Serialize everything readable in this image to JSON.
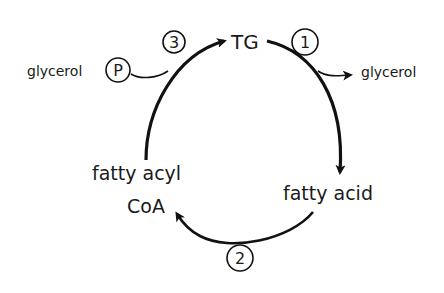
{
  "diagram": {
    "type": "metabolic-cycle",
    "nodes": {
      "tg": "TG",
      "fatty_acid": "fatty acid",
      "fatty_acyl_line1": "fatty acyl",
      "fatty_acyl_line2": "CoA"
    },
    "steps": {
      "step1": "1",
      "step2": "2",
      "step3": "3"
    },
    "side_inputs": {
      "glycerol_in": "glycerol",
      "phosphate": "P"
    },
    "side_outputs": {
      "glycerol_out": "glycerol"
    },
    "edges": [
      {
        "from": "TG",
        "to": "fatty acid",
        "step": "1",
        "byproduct": "glycerol"
      },
      {
        "from": "fatty acid",
        "to": "fatty acyl CoA",
        "step": "2"
      },
      {
        "from": "fatty acyl CoA",
        "to": "TG",
        "step": "3",
        "input": "glycerol-P"
      }
    ],
    "colors": {
      "ink": "#111111",
      "background": "#ffffff"
    }
  }
}
